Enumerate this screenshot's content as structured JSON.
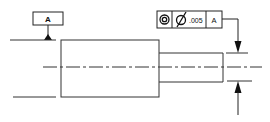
{
  "drawing": {
    "type": "GD&T concentricity callout on stepped shaft",
    "datum_feature": {
      "label": "A"
    },
    "feature_control_frame": {
      "symbol": "concentricity",
      "symbol_glyph": "◎",
      "diameter_glyph": "Ø",
      "tolerance": ".005",
      "datum_reference": "A"
    },
    "colors": {
      "line": "#222222",
      "background": "#ffffff"
    }
  }
}
